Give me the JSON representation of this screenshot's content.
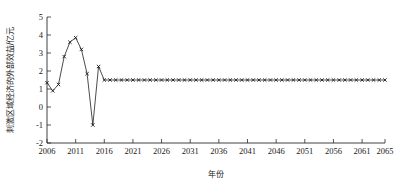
{
  "chart_data": {
    "type": "line",
    "title": "",
    "xlabel": "年份",
    "ylabel": "刺激区域经济的外部效益/亿元",
    "xlim": [
      2006,
      2065
    ],
    "ylim": [
      -2,
      5
    ],
    "grid": false,
    "legend": null,
    "marker": "x",
    "xticks": [
      2006,
      2011,
      2016,
      2021,
      2026,
      2031,
      2036,
      2041,
      2046,
      2051,
      2056,
      2061,
      2065
    ],
    "yticks": [
      -2,
      -1,
      0,
      1,
      2,
      3,
      4,
      5
    ],
    "ytick_labels": [
      "-2",
      "-1",
      "0",
      "1",
      "2",
      "3",
      "4",
      "5"
    ],
    "xtick_labels": [
      "2006",
      "2011",
      "2016",
      "2021",
      "2026",
      "2031",
      "2036",
      "2041",
      "2046",
      "2051",
      "2056",
      "2061",
      "2065"
    ],
    "series": [
      {
        "name": "刺激区域经济的外部效益",
        "x": [
          2006,
          2007,
          2008,
          2009,
          2010,
          2011,
          2012,
          2013,
          2014,
          2015,
          2016,
          2017,
          2018,
          2019,
          2020,
          2021,
          2022,
          2023,
          2024,
          2025,
          2026,
          2027,
          2028,
          2029,
          2030,
          2031,
          2032,
          2033,
          2034,
          2035,
          2036,
          2037,
          2038,
          2039,
          2040,
          2041,
          2042,
          2043,
          2044,
          2045,
          2046,
          2047,
          2048,
          2049,
          2050,
          2051,
          2052,
          2053,
          2054,
          2055,
          2056,
          2057,
          2058,
          2059,
          2060,
          2061,
          2062,
          2063,
          2064,
          2065
        ],
        "values": [
          1.35,
          0.9,
          1.25,
          2.8,
          3.6,
          3.85,
          3.2,
          1.85,
          -1.0,
          2.25,
          1.5,
          1.5,
          1.5,
          1.5,
          1.5,
          1.5,
          1.5,
          1.5,
          1.5,
          1.5,
          1.5,
          1.5,
          1.5,
          1.5,
          1.5,
          1.5,
          1.5,
          1.5,
          1.5,
          1.5,
          1.5,
          1.5,
          1.5,
          1.5,
          1.5,
          1.5,
          1.5,
          1.5,
          1.5,
          1.5,
          1.5,
          1.5,
          1.5,
          1.5,
          1.5,
          1.5,
          1.5,
          1.5,
          1.5,
          1.5,
          1.5,
          1.5,
          1.5,
          1.5,
          1.5,
          1.5,
          1.5,
          1.5,
          1.5,
          1.5
        ]
      }
    ]
  },
  "colors": {
    "line": "#1e1e1e",
    "axis": "#2b2b2b",
    "text": "#1a1a1a",
    "background": "#ffffff"
  }
}
